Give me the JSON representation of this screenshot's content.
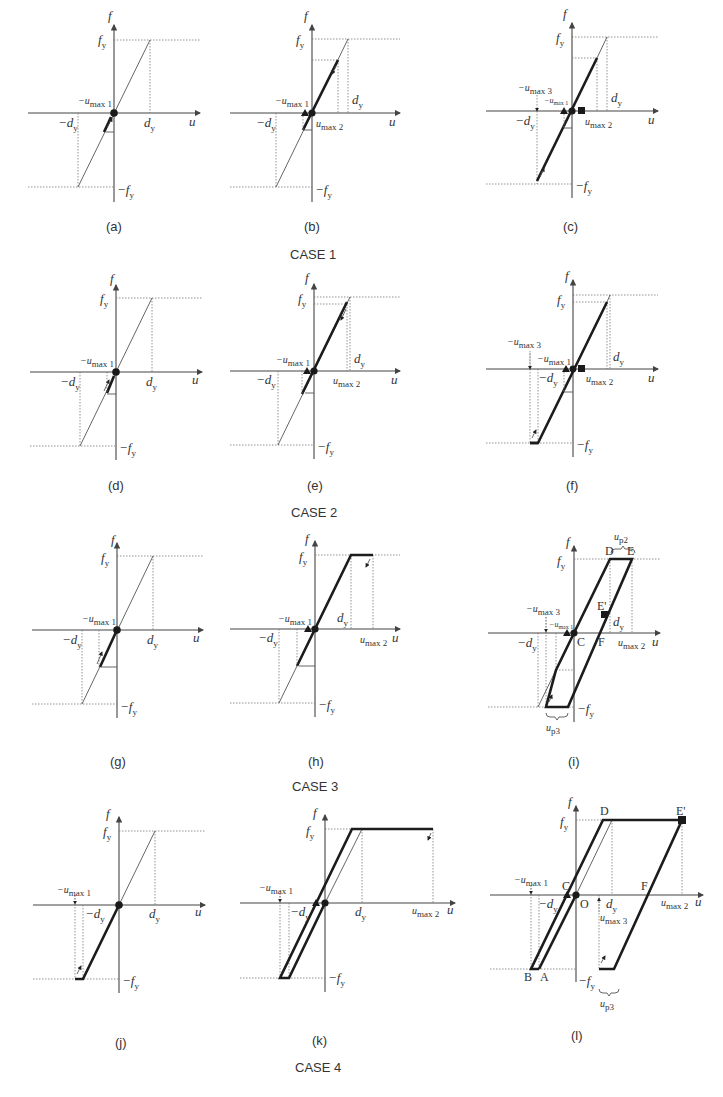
{
  "figure": {
    "axis_labels": {
      "x": "u",
      "y": "f"
    },
    "tick_labels": {
      "fy": "f",
      "fy_sub": "y",
      "neg_fy": "−f",
      "neg_fy_sub": "y",
      "dy": "d",
      "dy_sub": "y",
      "neg_dy": "−d",
      "neg_dy_sub": "y"
    },
    "marker_labels": {
      "neg_umax1": "−u",
      "neg_umax1_sub": "max 1",
      "umax2": "u",
      "umax2_sub": "max 2",
      "neg_umax3": "−u",
      "neg_umax3_sub": "max 3",
      "umax3": "u",
      "umax3_sub": "max 3",
      "up2": "u",
      "up2_sub": "p2",
      "up3": "u",
      "up3_sub": "p3"
    },
    "point_labels": {
      "A": "A",
      "B": "B",
      "C": "C",
      "D": "D",
      "E": "E",
      "E_prime": "E'",
      "F": "F",
      "O": "O"
    },
    "panels": [
      {
        "id": "a",
        "caption": "(a)"
      },
      {
        "id": "b",
        "caption": "(b)"
      },
      {
        "id": "c",
        "caption": "(c)"
      },
      {
        "id": "d",
        "caption": "(d)"
      },
      {
        "id": "e",
        "caption": "(e)"
      },
      {
        "id": "f",
        "caption": "(f)"
      },
      {
        "id": "g",
        "caption": "(g)"
      },
      {
        "id": "h",
        "caption": "(h)"
      },
      {
        "id": "i",
        "caption": "(i)"
      },
      {
        "id": "j",
        "caption": "(j)"
      },
      {
        "id": "k",
        "caption": "(k)"
      },
      {
        "id": "l",
        "caption": "(l)"
      }
    ],
    "cases": [
      {
        "label": "CASE 1"
      },
      {
        "label": "CASE 2"
      },
      {
        "label": "CASE 3"
      },
      {
        "label": "CASE 4"
      }
    ]
  }
}
